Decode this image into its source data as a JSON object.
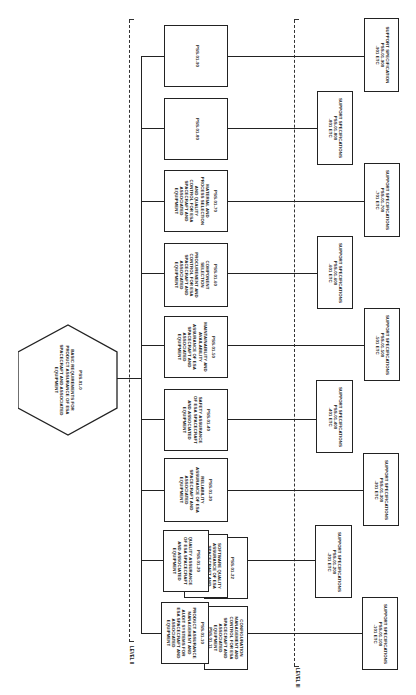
{
  "diagram": {
    "levels": [
      {
        "label": "LEVEL II"
      },
      {
        "label": "LEVEL III"
      }
    ],
    "root": {
      "id": "PSS-01-0",
      "lines": [
        "BASIC REQUIREMENTS FOR",
        "PRODUCT ASSURANCE OF ESA",
        "SPACECRAFT AND ASSOCIATED",
        "EQUIPMENT"
      ]
    },
    "level2": [
      {
        "id": "PSS-01-90",
        "lines": []
      },
      {
        "id": "PSS-01-80",
        "lines": []
      },
      {
        "id": "PSS-01-70",
        "lines": [
          "MATERIAL AND",
          "PROCESS SELECTION",
          "AND QUALITY",
          "CONTROL FOR ESA",
          "SPACECRAFT AND",
          "ASSOCIATED",
          "EQUIPMENT"
        ]
      },
      {
        "id": "PSS-01-60",
        "lines": [
          "COMPONENT",
          "SELECTION",
          "PROCUREMENT AND",
          "CONTROL FOR ESA",
          "SPACECRAFT AND",
          "ASSOCIATED",
          "EQUIPMENT"
        ]
      },
      {
        "id": "PSS-01-50",
        "lines": [
          "MAINTAINABILITY AND",
          "AVAILABILITY",
          "ASSURANCE OF ESA",
          "SPACECRAFT AND",
          "ASSOCIATED",
          "EQUIPMENT"
        ]
      },
      {
        "id": "PSS-01-40",
        "lines": [
          "SAFETY ASSURANCE",
          "OF ESA SPACECRAFT",
          "AND ASSOCIATED",
          "EQUIPMENT"
        ]
      },
      {
        "id": "PSS-01-30",
        "lines": [
          "RELIABILITY",
          "ASSURANCE OF ESA",
          "SPACECRAFT AND",
          "ASSOCIATED",
          "EQUIPMENT"
        ]
      },
      {
        "id": "PSS-01-20",
        "lines": [
          "QUALITY ASSURANCE",
          "OF ESA SPACECRAFT",
          "AND ASSOCIATED",
          "EQUIPMENT"
        ],
        "sub": [
          {
            "id": "PSS-01-21",
            "lines": [
              "SOFTWARE QUALITY",
              "ASSURANCE OF ESA",
              "SPACECRAFT AND",
              "ASSOCIATED",
              "EQUIPMENT"
            ]
          },
          {
            "id": "PSS-01-22",
            "lines": []
          }
        ]
      },
      {
        "id": "PSS-01-10",
        "lines": [
          "PRODUCT ASSURANCE",
          "MANAGEMENT AND",
          "AUDIT SYSTEMS FOR",
          "ESA SPACECRAFT AND",
          "ASSOCIATED",
          "EQUIPMENT"
        ],
        "sub": [
          {
            "id": "PSS-01-11",
            "lines": [
              "CONFIGURATION",
              "MANAGEMENT AND",
              "CONTROL FOR ESA",
              "SPACECRAFT AND",
              "ASSOCIATED",
              "EQUIPMENT"
            ]
          }
        ]
      }
    ],
    "level3": [
      {
        "title": "SUPPORT SPECIFICATION",
        "code": "PSS-01-900",
        "range": "-901 ETC"
      },
      {
        "title": "SUPPORT SPECIFICATIONS",
        "code": "PSS-01-800",
        "range": "-801 ETC"
      },
      {
        "title": "SUPPORT SPECIFICATIONS",
        "code": "PSS-01-700",
        "range": "-701 ETC"
      },
      {
        "title": "SUPPORT SPECIFICATIONS",
        "code": "PSS-01-600",
        "range": "-601 ETC"
      },
      {
        "title": "SUPPORT SPECIFICATIONS",
        "code": "PSS-01-500",
        "range": "-501 ETC"
      },
      {
        "title": "SUPPORT SPECIFICATIONS",
        "code": "PSS-01-400",
        "range": "-401 ETC"
      },
      {
        "title": "SUPPORT SPECIFICATIONS",
        "code": "PSS-01-300",
        "range": "-301 ETC"
      },
      {
        "title": "SUPPORT SPECIFICATIONS",
        "code": "PSS-01-200",
        "range": "-201 ETC"
      },
      {
        "title": "SUPPORT SPECIFICATIONS",
        "code": "PSS-01-100",
        "range": "-101 ETC"
      }
    ]
  }
}
